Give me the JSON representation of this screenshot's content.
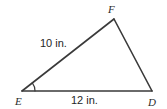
{
  "figure": {
    "kind": "geometry-triangle-diagram",
    "background_color": "#ffffff",
    "stroke_color": "#3a3a3a",
    "stroke_width": 1.6,
    "text_color": "#2b2b2b",
    "width": 167,
    "height": 109
  },
  "triangle": {
    "name": "EFD",
    "vertices": [
      {
        "id": "E",
        "label": "E",
        "x": 22,
        "y": 91,
        "label_x": 15,
        "label_y": 105
      },
      {
        "id": "F",
        "label": "F",
        "x": 114,
        "y": 19,
        "label_x": 108,
        "label_y": 13
      },
      {
        "id": "D",
        "label": "D",
        "x": 152,
        "y": 91,
        "label_x": 148,
        "label_y": 106
      }
    ],
    "edges": [
      {
        "id": "EF",
        "from": "E",
        "to": "F",
        "measure_label": "10 in.",
        "label_x": 40,
        "label_y": 47
      },
      {
        "id": "FD",
        "from": "F",
        "to": "D",
        "measure_label": "",
        "label_x": 0,
        "label_y": 0
      },
      {
        "id": "ED",
        "from": "E",
        "to": "D",
        "measure_label": "12 in.",
        "label_x": 71,
        "label_y": 104
      }
    ],
    "angle_marks": [
      {
        "id": "angle-E",
        "at_vertex": "E",
        "radius": 13,
        "label": ""
      }
    ]
  },
  "labels": {
    "vertex_f": "F",
    "vertex_e": "E",
    "vertex_d": "D",
    "side_ef_measure": "10 in.",
    "side_ed_measure": "12 in."
  }
}
